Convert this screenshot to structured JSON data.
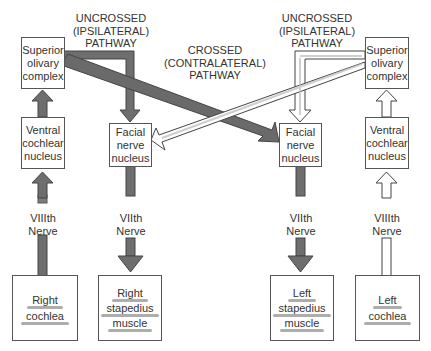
{
  "labels": {
    "uncrossed_left": [
      "UNCROSSED",
      "(IPSILATERAL)",
      "PATHWAY"
    ],
    "uncrossed_right": [
      "UNCROSSED",
      "(IPSILATERAL)",
      "PATHWAY"
    ],
    "crossed": [
      "CROSSED",
      "(CONTRALATERAL)",
      "PATHWAY"
    ],
    "nerve_viii_left": [
      "VIIIth",
      "Nerve"
    ],
    "nerve_vii_right_side": [
      "VIIth",
      "Nerve"
    ],
    "nerve_vii_left_side": [
      "VIIth",
      "Nerve"
    ],
    "nerve_viii_right": [
      "VIIIth",
      "Nerve"
    ]
  },
  "boxes": {
    "soc_left": [
      "Superior",
      "olivary",
      "complex"
    ],
    "vcn_left": [
      "Ventral",
      "cochlear",
      "nucleus"
    ],
    "facial_right": [
      "Facial",
      "nerve",
      "nucleus"
    ],
    "facial_left": [
      "Facial",
      "nerve",
      "nucleus"
    ],
    "soc_right": [
      "Superior",
      "olivary",
      "complex"
    ],
    "vcn_right": [
      "Ventral",
      "cochlear",
      "nucleus"
    ],
    "right_cochlea": [
      "Right",
      "cochlea"
    ],
    "right_stapedius": [
      "Right",
      "stapedius",
      "muscle"
    ],
    "left_stapedius": [
      "Left",
      "stapedius",
      "muscle"
    ],
    "left_cochlea": [
      "Left",
      "cochlea"
    ]
  },
  "colors": {
    "dark_pathway": "#6e6e6e",
    "light_pathway": "#ffffff",
    "outline": "#444444"
  }
}
